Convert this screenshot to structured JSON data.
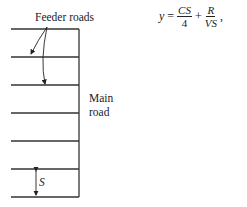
{
  "labels": {
    "feeder_roads": "Feeder roads",
    "main_road_line1": "Main",
    "main_road_line2": "road",
    "spacing": "S"
  },
  "equation": {
    "lhs": "y",
    "equals": "=",
    "term1": {
      "numerator": "CS",
      "denominator": "4"
    },
    "plus": "+",
    "term2": {
      "numerator": "R",
      "denominator": "VS"
    },
    "trailing": ","
  }
}
